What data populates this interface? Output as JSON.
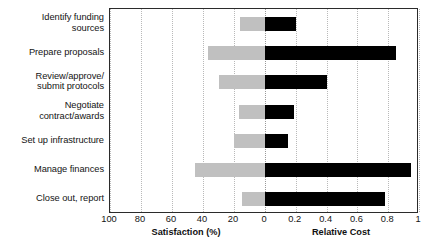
{
  "chart_data": {
    "type": "bar",
    "orientation": "horizontal",
    "title": "",
    "subtitle": "",
    "categories": [
      "Identify funding sources",
      "Prepare proposals",
      "Review/approve/ submit protocols",
      "Negotiate contract/awards",
      "Set up infrastructure",
      "Manage finances",
      "Close out, report"
    ],
    "category_lines": [
      [
        "Identify funding",
        "sources"
      ],
      [
        "Prepare proposals"
      ],
      [
        "Review/approve/",
        "submit protocols"
      ],
      [
        "Negotiate",
        "contract/awards"
      ],
      [
        "Set up infrastructure"
      ],
      [
        "Manage finances"
      ],
      [
        "Close out, report"
      ]
    ],
    "series": [
      {
        "name": "Satisfaction (%)",
        "axis": "left",
        "color": "#c0c0c0",
        "direction": "left",
        "values": [
          16,
          37,
          30,
          17,
          20,
          45,
          15
        ]
      },
      {
        "name": "Relative Cost",
        "axis": "right",
        "color": "#000000",
        "direction": "right",
        "values": [
          0.2,
          0.85,
          0.4,
          0.19,
          0.15,
          0.95,
          0.78
        ]
      }
    ],
    "left_axis": {
      "label": "Satisfaction (%)",
      "ticks": [
        100,
        80,
        60,
        40,
        20,
        0
      ],
      "tick_labels": [
        "100",
        "80",
        "60",
        "40",
        "20",
        "0"
      ],
      "range": [
        100,
        0
      ],
      "reversed": true
    },
    "right_axis": {
      "label": "Relative Cost",
      "ticks": [
        0,
        0.2,
        0.4,
        0.6,
        0.8,
        1
      ],
      "tick_labels": [
        "0",
        "0.2",
        "0.4",
        "0.6",
        "0.8",
        "1"
      ],
      "range": [
        0,
        1
      ]
    },
    "xlabel": "",
    "ylabel": "",
    "grid": true,
    "grid_style": "dotted-vertical",
    "legend": "none",
    "frame": true
  },
  "axis_labels": {
    "left_title": "Satisfaction (%)",
    "right_title": "Relative Cost"
  }
}
